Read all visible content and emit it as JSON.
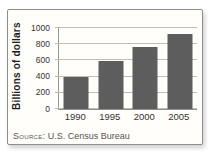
{
  "figure": {
    "source": {
      "prefix": "Source:",
      "text": "U.S. Census Bureau"
    }
  },
  "chart_data": {
    "type": "bar",
    "categories": [
      "1990",
      "1995",
      "2000",
      "2005"
    ],
    "values": [
      390,
      590,
      770,
      920
    ],
    "title": "",
    "xlabel": "",
    "ylabel": "Billions of dollars",
    "ylim": [
      0,
      1000
    ],
    "yticks": [
      0,
      200,
      400,
      600,
      800,
      1000
    ],
    "grid": true,
    "legend": false,
    "bar_color": "#5d5d5d",
    "gridline_color": "#bdbdbd",
    "axis_color": "#8f8f8f",
    "source_note": "Source: U.S. Census Bureau"
  }
}
